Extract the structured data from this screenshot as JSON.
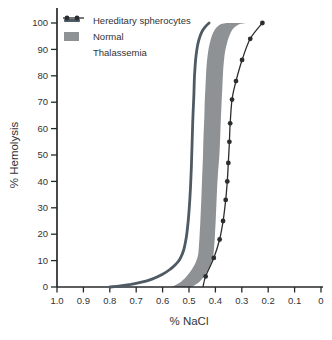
{
  "colors": {
    "background": "#ffffff",
    "axis": "#26292b",
    "text": "#333333",
    "hereditary": "#4e5a64",
    "normal_band": "#8e9295",
    "thalassemia": "#2b2e30"
  },
  "legend": {
    "items": [
      {
        "label": "Hereditary spherocytes",
        "swatch": "thick-line"
      },
      {
        "label": "Normal",
        "swatch": "filled-band"
      },
      {
        "label": "Thalassemia",
        "swatch": "line-with-dots"
      }
    ]
  },
  "chart_data": {
    "type": "line",
    "title": "",
    "xlabel": "% NaCl",
    "ylabel": "% Hemolysis",
    "grid": false,
    "legend_position": "top-left",
    "x_axis": {
      "min": 0,
      "max": 1.0,
      "reversed": true,
      "ticks": [
        1.0,
        0.9,
        0.8,
        0.7,
        0.6,
        0.5,
        0.4,
        0.3,
        0.2,
        0.1,
        0
      ],
      "tick_labels": [
        "1.0",
        "0.9",
        "0.8",
        "0.7",
        "0.6",
        "0.5",
        "0.4",
        "0.3",
        "0.2",
        "0.1",
        "0"
      ]
    },
    "y_axis": {
      "min": 0,
      "max": 100,
      "ticks": [
        0,
        10,
        20,
        30,
        40,
        50,
        60,
        70,
        80,
        90,
        100
      ],
      "tick_labels": [
        "0",
        "10",
        "20",
        "30",
        "40",
        "50",
        "60",
        "70",
        "80",
        "90",
        "100"
      ]
    },
    "series": [
      {
        "name": "Hereditary spherocytes",
        "style": "line",
        "color": "#4e5a64",
        "line_width": 2.8,
        "points": [
          [
            0.8,
            0
          ],
          [
            0.76,
            0.4
          ],
          [
            0.72,
            1.0
          ],
          [
            0.68,
            1.8
          ],
          [
            0.64,
            3.0
          ],
          [
            0.6,
            4.8
          ],
          [
            0.57,
            6.8
          ],
          [
            0.55,
            8.6
          ],
          [
            0.535,
            10.5
          ],
          [
            0.52,
            14
          ],
          [
            0.51,
            19
          ],
          [
            0.503,
            25
          ],
          [
            0.497,
            33
          ],
          [
            0.492,
            43
          ],
          [
            0.489,
            52
          ],
          [
            0.486,
            62
          ],
          [
            0.482,
            72
          ],
          [
            0.479,
            80
          ],
          [
            0.475,
            86
          ],
          [
            0.47,
            90
          ],
          [
            0.463,
            93.5
          ],
          [
            0.452,
            96.5
          ],
          [
            0.438,
            98.6
          ],
          [
            0.424,
            100
          ]
        ]
      },
      {
        "name": "Normal",
        "style": "band",
        "color": "#8e9295",
        "left_edge": [
          [
            0.565,
            0
          ],
          [
            0.53,
            2
          ],
          [
            0.505,
            4.5
          ],
          [
            0.487,
            7
          ],
          [
            0.474,
            9.5
          ],
          [
            0.466,
            12
          ],
          [
            0.462,
            16
          ],
          [
            0.459,
            21
          ],
          [
            0.456,
            27
          ],
          [
            0.453,
            34
          ],
          [
            0.45,
            42
          ],
          [
            0.447,
            50
          ],
          [
            0.445,
            57
          ],
          [
            0.442,
            64
          ],
          [
            0.44,
            71
          ],
          [
            0.437,
            77
          ],
          [
            0.434,
            83
          ],
          [
            0.429,
            88
          ],
          [
            0.422,
            92
          ],
          [
            0.412,
            95.5
          ],
          [
            0.398,
            98
          ],
          [
            0.38,
            99.5
          ],
          [
            0.358,
            100
          ]
        ],
        "right_edge": [
          [
            0.489,
            0
          ],
          [
            0.46,
            2
          ],
          [
            0.44,
            4.5
          ],
          [
            0.425,
            7
          ],
          [
            0.415,
            9.5
          ],
          [
            0.408,
            12
          ],
          [
            0.404,
            16
          ],
          [
            0.401,
            21
          ],
          [
            0.398,
            27
          ],
          [
            0.395,
            34
          ],
          [
            0.391,
            42
          ],
          [
            0.385,
            50
          ],
          [
            0.382,
            57
          ],
          [
            0.379,
            64
          ],
          [
            0.376,
            71
          ],
          [
            0.373,
            77
          ],
          [
            0.37,
            83
          ],
          [
            0.365,
            88
          ],
          [
            0.357,
            92
          ],
          [
            0.346,
            95.5
          ],
          [
            0.331,
            98
          ],
          [
            0.31,
            99.5
          ],
          [
            0.285,
            100
          ]
        ]
      },
      {
        "name": "Thalassemia",
        "style": "line-markers",
        "color": "#2b2e30",
        "line_width": 1.3,
        "marker": "filled-circle",
        "marker_radius": 2.4,
        "points": [
          [
            0.447,
            0
          ],
          [
            0.437,
            4
          ],
          [
            0.406,
            11
          ],
          [
            0.384,
            18
          ],
          [
            0.371,
            25
          ],
          [
            0.361,
            33
          ],
          [
            0.355,
            40
          ],
          [
            0.351,
            47
          ],
          [
            0.347,
            55
          ],
          [
            0.344,
            62
          ],
          [
            0.337,
            71
          ],
          [
            0.322,
            78
          ],
          [
            0.299,
            86
          ],
          [
            0.268,
            94
          ],
          [
            0.222,
            100
          ]
        ]
      }
    ]
  }
}
